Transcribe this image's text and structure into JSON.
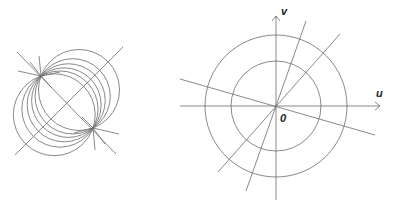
{
  "left_figure": {
    "description": "Coaxial circles through two focal points with perpendicular bisector line",
    "focus_a": [
      41,
      76
    ],
    "focus_b": [
      93,
      128
    ],
    "circle_offsets": [
      -18,
      -10,
      -4,
      2,
      8,
      17
    ],
    "stroke_color": "#6b6b6b"
  },
  "right_figure": {
    "axis_labels": {
      "u": "u",
      "v": "v",
      "origin": "0"
    },
    "center": [
      276,
      106
    ],
    "circle_radii": [
      45,
      71
    ],
    "stroke_color": "#6b6b6b"
  }
}
